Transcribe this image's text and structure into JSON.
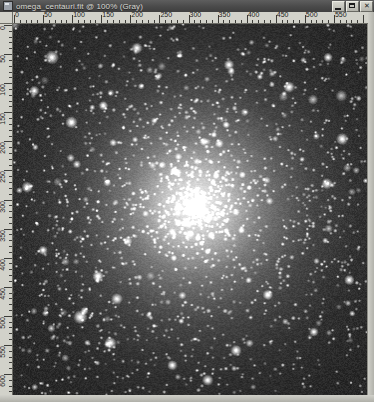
{
  "window": {
    "title": "omega_centauri.fit @ 100% (Gray)",
    "filename": "omega_centauri.fit",
    "zoom_level": "100%",
    "color_mode": "Gray",
    "icon": "image-document-icon",
    "titlebar_color": "#4a4a4a",
    "controls": {
      "minimize_label": "_",
      "maximize_label": "□",
      "close_label": "✕"
    }
  },
  "rulers": {
    "unit_label": "pixels",
    "horizontal": {
      "labels": [
        "0",
        "50",
        "100",
        "150",
        "200",
        "250",
        "300",
        "350",
        "400",
        "450",
        "500",
        "550"
      ],
      "values": [
        0,
        50,
        100,
        150,
        200,
        250,
        300,
        350,
        400,
        450,
        500,
        550
      ],
      "origin_px": 1,
      "scale_px_per_unit": 0.5817,
      "minor_step": 10,
      "mid_step": 25,
      "major_step": 50
    },
    "vertical": {
      "labels": [
        "0",
        "50",
        "100",
        "150",
        "200",
        "250",
        "300",
        "350",
        "400",
        "450",
        "500",
        "550",
        "600"
      ],
      "values": [
        0,
        50,
        100,
        150,
        200,
        250,
        300,
        350,
        400,
        450,
        500,
        550,
        600
      ],
      "origin_px": 1,
      "scale_px_per_unit": 0.5817,
      "minor_step": 10,
      "mid_step": 25,
      "major_step": 50
    }
  },
  "image": {
    "description": "Grayscale astronomical exposure of the globular cluster Omega Centauri",
    "background_color": "#272727",
    "star_color": "#f2f2f2",
    "core": {
      "center_x_pct": 51.5,
      "center_y_pct": 49.0,
      "radius_pct": 30,
      "peak_brightness": "#e8e8e8"
    },
    "field_star_count": 900,
    "core_star_count": 1400,
    "bright_stars": [
      {
        "x_pct": 11.0,
        "y_pct": 9.0,
        "size": 3.0
      },
      {
        "x_pct": 35.0,
        "y_pct": 6.5,
        "size": 2.4
      },
      {
        "x_pct": 6.0,
        "y_pct": 18.0,
        "size": 2.2
      },
      {
        "x_pct": 16.5,
        "y_pct": 26.5,
        "size": 2.6
      },
      {
        "x_pct": 25.5,
        "y_pct": 22.0,
        "size": 2.0
      },
      {
        "x_pct": 61.0,
        "y_pct": 11.0,
        "size": 2.2
      },
      {
        "x_pct": 78.0,
        "y_pct": 17.0,
        "size": 2.4
      },
      {
        "x_pct": 89.0,
        "y_pct": 9.0,
        "size": 2.0
      },
      {
        "x_pct": 93.0,
        "y_pct": 31.0,
        "size": 2.6
      },
      {
        "x_pct": 4.0,
        "y_pct": 44.0,
        "size": 2.4
      },
      {
        "x_pct": 8.5,
        "y_pct": 61.0,
        "size": 2.0
      },
      {
        "x_pct": 19.0,
        "y_pct": 79.0,
        "size": 3.0
      },
      {
        "x_pct": 27.5,
        "y_pct": 86.0,
        "size": 2.6
      },
      {
        "x_pct": 24.0,
        "y_pct": 68.0,
        "size": 2.4
      },
      {
        "x_pct": 45.0,
        "y_pct": 92.0,
        "size": 2.2
      },
      {
        "x_pct": 63.0,
        "y_pct": 88.0,
        "size": 2.4
      },
      {
        "x_pct": 72.0,
        "y_pct": 73.0,
        "size": 2.2
      },
      {
        "x_pct": 85.0,
        "y_pct": 83.0,
        "size": 2.0
      },
      {
        "x_pct": 95.0,
        "y_pct": 69.0,
        "size": 2.2
      },
      {
        "x_pct": 55.0,
        "y_pct": 96.0,
        "size": 2.4
      }
    ]
  }
}
